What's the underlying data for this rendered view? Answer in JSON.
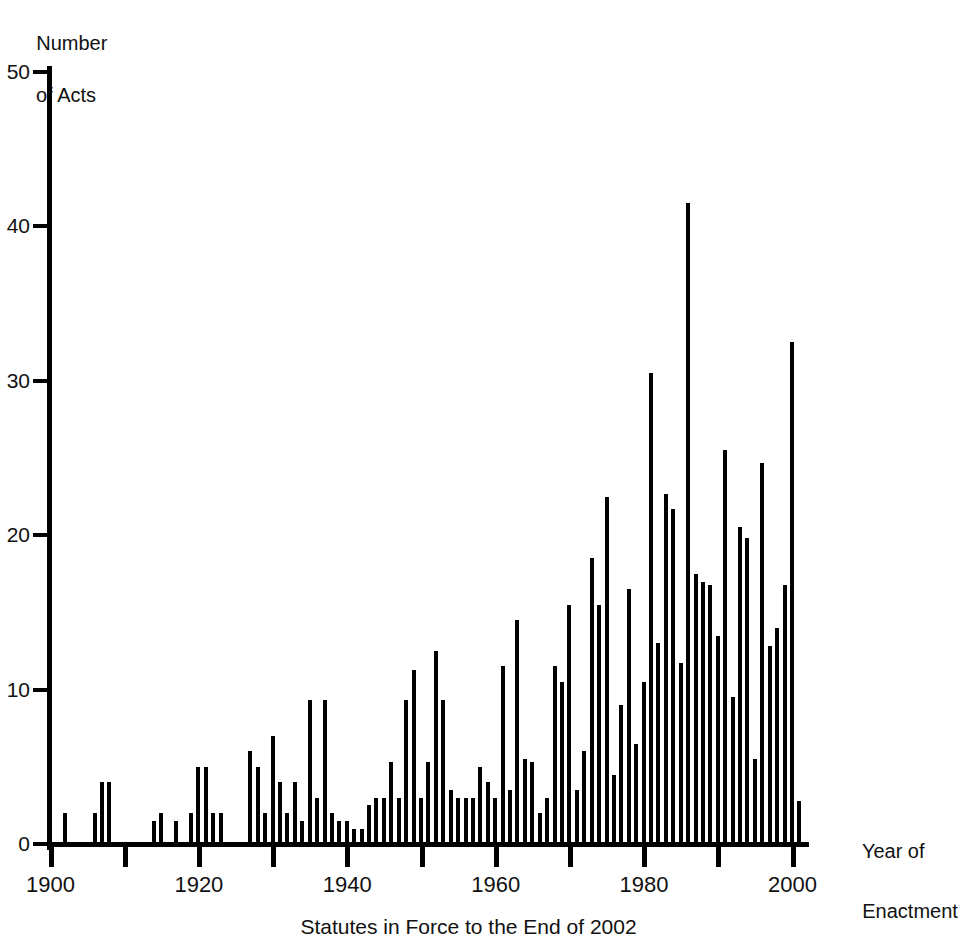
{
  "chart_data": {
    "type": "bar",
    "title": "",
    "caption": "Statutes in Force to the End of 2002",
    "xlabel": "Year of\nEnactment",
    "xlabel_line1": "Year of",
    "xlabel_line2": "Enactment",
    "ylabel": "Number\nof Acts",
    "ylabel_line1": "Number",
    "ylabel_line2": "of Acts",
    "xlim": [
      1899,
      2003
    ],
    "ylim": [
      0,
      50
    ],
    "grid": false,
    "legend": null,
    "ytick_labels": [
      "0",
      "10",
      "20",
      "30",
      "40",
      "50"
    ],
    "ytick_values": [
      0,
      10,
      20,
      30,
      40,
      50
    ],
    "xtick_labels": [
      "1900",
      "1920",
      "1940",
      "1960",
      "1980",
      "2000"
    ],
    "xtick_values": [
      1900,
      1920,
      1940,
      1960,
      1980,
      2000
    ],
    "xtick_minor_values": [
      1910,
      1930,
      1950,
      1970,
      1990
    ],
    "bar_color": "#000000",
    "axis_color": "#000000",
    "categories": [
      1900,
      1901,
      1902,
      1903,
      1904,
      1905,
      1906,
      1907,
      1908,
      1909,
      1910,
      1911,
      1912,
      1913,
      1914,
      1915,
      1916,
      1917,
      1918,
      1919,
      1920,
      1921,
      1922,
      1923,
      1924,
      1925,
      1926,
      1927,
      1928,
      1929,
      1930,
      1931,
      1932,
      1933,
      1934,
      1935,
      1936,
      1937,
      1938,
      1939,
      1940,
      1941,
      1942,
      1943,
      1944,
      1945,
      1946,
      1947,
      1948,
      1949,
      1950,
      1951,
      1952,
      1953,
      1954,
      1955,
      1956,
      1957,
      1958,
      1959,
      1960,
      1961,
      1962,
      1963,
      1964,
      1965,
      1966,
      1967,
      1968,
      1969,
      1970,
      1971,
      1972,
      1973,
      1974,
      1975,
      1976,
      1977,
      1978,
      1979,
      1980,
      1981,
      1982,
      1983,
      1984,
      1985,
      1986,
      1987,
      1988,
      1989,
      1990,
      1991,
      1992,
      1993,
      1994,
      1995,
      1996,
      1997,
      1998,
      1999,
      2000,
      2001,
      2002
    ],
    "values": [
      0,
      0,
      2,
      0,
      0,
      0,
      2,
      4,
      4,
      0,
      0,
      0,
      0,
      0,
      1.5,
      2,
      0,
      1.5,
      0,
      2,
      5,
      5,
      2,
      2,
      0,
      0,
      0,
      6,
      5,
      2,
      7,
      4,
      2,
      4,
      1.5,
      9.3,
      3,
      9.3,
      2,
      1.5,
      1.5,
      1,
      1,
      2.5,
      3,
      3,
      5.3,
      3,
      9.3,
      11.3,
      3,
      5.3,
      12.5,
      9.3,
      3.5,
      3,
      3,
      3,
      5,
      4,
      3,
      11.5,
      3.5,
      14.5,
      5.5,
      5.3,
      2,
      3,
      11.5,
      10.5,
      15.5,
      3.5,
      6,
      18.5,
      15.5,
      22.5,
      4.5,
      9,
      16.5,
      6.5,
      10.5,
      30.5,
      13,
      22.7,
      21.7,
      11.7,
      41.5,
      17.5,
      17,
      16.8,
      13.5,
      25.5,
      9.5,
      20.5,
      19.8,
      5.5,
      24.7,
      12.8,
      14,
      16.8,
      32.5,
      2.8,
      0
    ]
  }
}
